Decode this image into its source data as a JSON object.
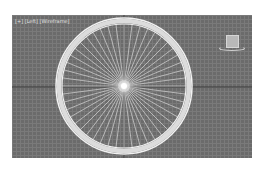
{
  "viewport": {
    "label": "[+] [Left] [Wireframe]",
    "background_color": "#6b6b6b",
    "grid_color": "#7a7a7a",
    "axis_color": "#3a3a3a"
  },
  "scene": {
    "object": "spoked-wheel",
    "rim_color": "#f0f0f0",
    "spoke_color": "#e8e8e8",
    "spoke_count": 48
  },
  "gizmo": {
    "name": "viewcube"
  }
}
